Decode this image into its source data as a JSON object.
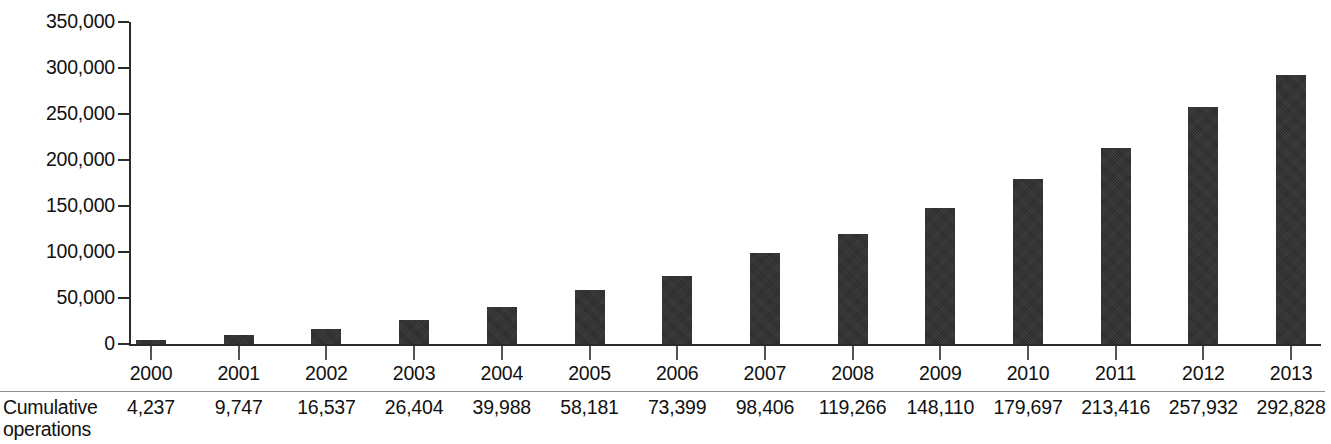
{
  "chart_data": {
    "type": "bar",
    "title": "",
    "subtitle": "",
    "xlabel": "",
    "ylabel": "",
    "categories": [
      "2000",
      "2001",
      "2002",
      "2003",
      "2004",
      "2005",
      "2006",
      "2007",
      "2008",
      "2009",
      "2010",
      "2011",
      "2012",
      "2013"
    ],
    "values": [
      4237,
      9747,
      16537,
      26404,
      39988,
      58181,
      73399,
      98406,
      119266,
      148110,
      179697,
      213416,
      257932,
      292828
    ],
    "value_labels": [
      "4,237",
      "9,747",
      "16,537",
      "26,404",
      "39,988",
      "58,181",
      "73,399",
      "98,406",
      "119,266",
      "148,110",
      "179,697",
      "213,416",
      "257,932",
      "292,828"
    ],
    "series": [
      {
        "name": "Cumulative operations",
        "values": [
          4237,
          9747,
          16537,
          26404,
          39988,
          58181,
          73399,
          98406,
          119266,
          148110,
          179697,
          213416,
          257932,
          292828
        ]
      }
    ],
    "ylim": [
      0,
      350000
    ],
    "ytick_values": [
      0,
      50000,
      100000,
      150000,
      200000,
      250000,
      300000,
      350000
    ],
    "ytick_labels": [
      "0",
      "50,000",
      "100,000",
      "150,000",
      "200,000",
      "250,000",
      "300,000",
      "350,000"
    ],
    "grid": false,
    "legend": false,
    "legend_position": "none",
    "bar_color": "#333333",
    "axis_color": "#2b2b2b",
    "text_color": "#111111"
  },
  "table": {
    "row_label": "Cumulative operations",
    "row_label_line1": "Cumulative",
    "row_label_line2": "operations"
  }
}
